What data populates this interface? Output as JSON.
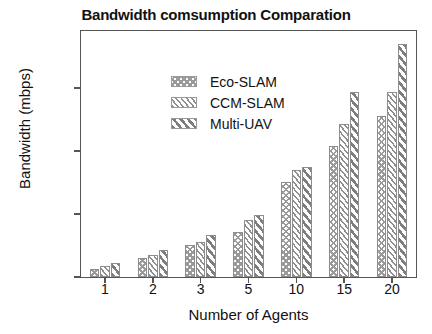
{
  "chart_data": {
    "type": "bar",
    "title": "Bandwidth comsumption Comparation",
    "xlabel": "Number of Agents",
    "ylabel": "Bandwidth (mbps)",
    "categories": [
      "1",
      "2",
      "3",
      "5",
      "10",
      "15",
      "20"
    ],
    "series": [
      {
        "name": "Eco-SLAM",
        "values": [
          13,
          30,
          50,
          71,
          150,
          208,
          256
        ]
      },
      {
        "name": "CCM-SLAM",
        "values": [
          17,
          35,
          56,
          90,
          170,
          243,
          293
        ]
      },
      {
        "name": "Multi-UAV",
        "values": [
          22,
          43,
          66,
          99,
          175,
          294,
          370
        ]
      }
    ],
    "yticks": [
      0,
      100,
      200,
      300
    ],
    "ylim": [
      0,
      390
    ],
    "grid": false,
    "legend_position": "top-left",
    "colors": {
      "eco_slam": "#9a9a9a",
      "ccm_slam": "#8f8f8f",
      "multi_uav": "#7e7e7e",
      "axis": "#555555",
      "text": "#111111",
      "background": "#ffffff"
    }
  }
}
